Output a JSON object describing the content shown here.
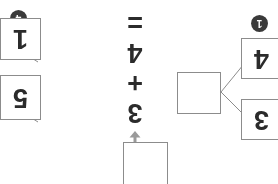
{
  "page": {
    "background_color": "#ffffff",
    "rotation_degrees": 180
  },
  "palette": {
    "box_border": "#8c8c8c",
    "connector_line": "#8c8c8c",
    "digit_text": "#2b2b2b",
    "badge_fill": "#3a3a3a",
    "badge_text": "#ffffff",
    "arrow": "#9a9a9a"
  },
  "badges": [
    {
      "name": "step-badge-1",
      "label": "1"
    },
    {
      "name": "step-badge-4",
      "label": "4"
    }
  ],
  "equation": {
    "arrow_icon": "arrow-down-icon",
    "first_addend": "3",
    "operator": "+",
    "second_addend": "4",
    "equals": "=",
    "full_text": "3 + 4 ="
  },
  "boxes": [
    {
      "name": "answer-box",
      "value": "",
      "empty": true
    },
    {
      "name": "decompose-box",
      "value": "",
      "empty": true
    },
    {
      "name": "option-box-3",
      "value": "3",
      "empty": false
    },
    {
      "name": "option-box-4",
      "value": "4",
      "empty": false
    },
    {
      "name": "option-box-5",
      "value": "5",
      "empty": false
    },
    {
      "name": "option-box-1",
      "value": "1",
      "empty": false
    }
  ],
  "connectors": {
    "count": 4,
    "description": "lines joining the decompose box to option boxes"
  }
}
